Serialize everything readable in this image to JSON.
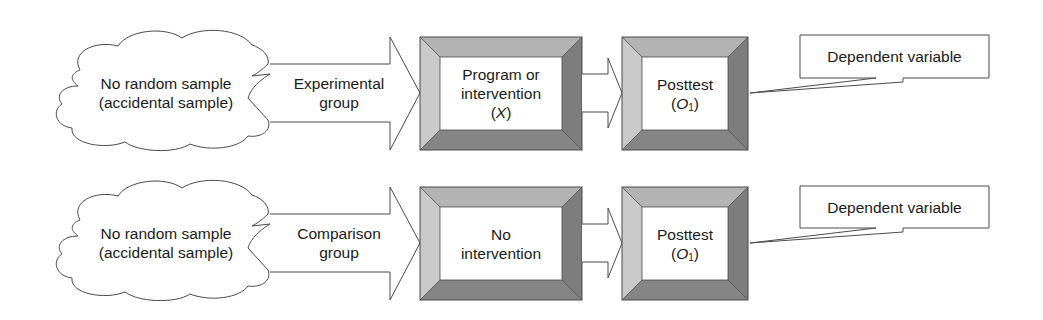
{
  "diagram": {
    "type": "research-design-flow",
    "colors": {
      "stroke": "#4a4a4a",
      "bevel_top": "#b3b3b3",
      "bevel_left": "#c9c9c9",
      "bevel_right": "#7d7d7d",
      "bevel_bottom": "#858585",
      "fill": "#ffffff"
    },
    "rows": [
      {
        "sample": {
          "line1": "No random sample",
          "line2": "(accidental sample)"
        },
        "group_arrow": {
          "line1": "Experimental",
          "line2": "group"
        },
        "treatment": {
          "line1": "Program or",
          "line2": "intervention",
          "line3_pre": "(",
          "line3_var": "X",
          "line3_post": ")"
        },
        "posttest": {
          "line1": "Posttest",
          "line2_pre": "(",
          "line2_var": "O",
          "line2_sub": "1",
          "line2_post": ")"
        },
        "callout": {
          "text": "Dependent variable"
        }
      },
      {
        "sample": {
          "line1": "No random sample",
          "line2": "(accidental sample)"
        },
        "group_arrow": {
          "line1": "Comparison",
          "line2": "group"
        },
        "treatment": {
          "line1": "No",
          "line2": "intervention"
        },
        "posttest": {
          "line1": "Posttest",
          "line2_pre": "(",
          "line2_var": "O",
          "line2_sub": "1",
          "line2_post": ")"
        },
        "callout": {
          "text": "Dependent variable"
        }
      }
    ]
  }
}
